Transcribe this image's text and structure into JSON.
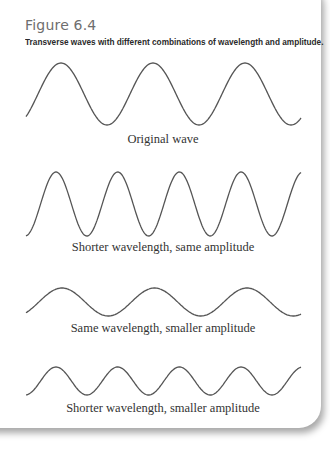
{
  "figure": {
    "title": "Figure 6.4",
    "caption": "Transverse waves with different combinations of wavelength and amplitude."
  },
  "panels": [
    {
      "label": "Original wave",
      "wavelength": "original",
      "amplitude": "original",
      "cycles": 3
    },
    {
      "label": "Shorter wavelength, same amplitude",
      "wavelength": "shorter",
      "amplitude": "original",
      "cycles": 4.5
    },
    {
      "label": "Same wavelength, smaller amplitude",
      "wavelength": "original",
      "amplitude": "smaller",
      "cycles": 3
    },
    {
      "label": "Shorter wavelength, smaller amplitude",
      "wavelength": "shorter",
      "amplitude": "smaller",
      "cycles": 4.5
    }
  ],
  "colors": {
    "wave_stroke": "#555555",
    "title": "#6e6e6e",
    "caption": "#2a2a2a"
  }
}
